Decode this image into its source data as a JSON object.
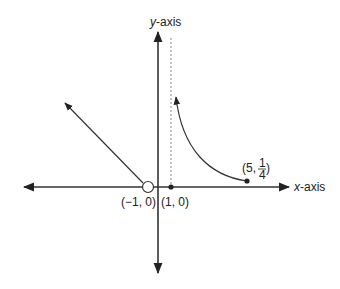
{
  "diagram": {
    "title": "",
    "axes": {
      "x_label_var": "x",
      "x_label_suffix": "-axis",
      "y_label_var": "y",
      "y_label_suffix": "-axis"
    },
    "points": [
      {
        "id": "open-point",
        "label": "(−1, 0)",
        "x": -1,
        "y": 0,
        "style": "open"
      },
      {
        "id": "closed-point-1",
        "label": "(1, 0)",
        "x": 1,
        "y": 0,
        "style": "closed"
      },
      {
        "id": "closed-point-5",
        "label_prefix": "(5,",
        "label_num": "1",
        "label_den": "4",
        "label_suffix": ")",
        "x": 5,
        "y": 0.25,
        "style": "closed"
      }
    ],
    "asymptote": {
      "type": "vertical",
      "x": 1,
      "style": "dashed"
    },
    "pieces": [
      {
        "id": "ray",
        "description": "line from open point (-1,0) going up-left with arrow"
      },
      {
        "id": "curve",
        "description": "curve from (5, 1/4) rising toward vertical asymptote x=1 with arrow"
      }
    ],
    "colors": {
      "ink": "#222222",
      "asymptote": "#888888"
    }
  }
}
